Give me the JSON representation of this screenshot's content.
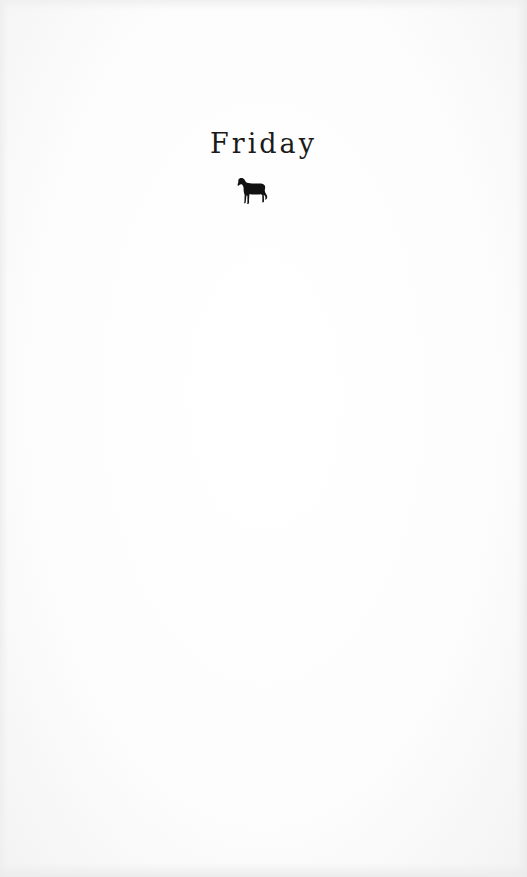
{
  "page": {
    "chapter_title": "Friday",
    "ornament": {
      "icon": "dog-silhouette-icon",
      "color": "#111111"
    },
    "background_color": "#fdfdfd",
    "text_color": "#1b1b1b"
  }
}
